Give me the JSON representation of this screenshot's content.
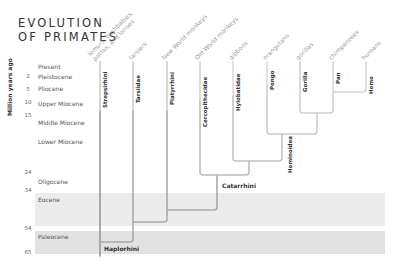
{
  "title": {
    "line1": "EVOLUTION",
    "line2": "OF PRIMATES"
  },
  "axis": {
    "label": "Million years ago",
    "ticks": [
      "2",
      "5",
      "10",
      "15",
      "24",
      "34",
      "54",
      "65"
    ]
  },
  "epochs": [
    "Present",
    "Pleistocene",
    "Pliocene",
    "Upper Miocene",
    "Middle Miocene",
    "Lower Miocene",
    "Oligocene",
    "Eocene",
    "Paleocene"
  ],
  "taxa": [
    {
      "common": "lemurs, bushbabies,",
      "common2": "pottos, and lorises",
      "scientific": "Strepsirhini"
    },
    {
      "common": "tarsiers",
      "scientific": "Tarsiidae"
    },
    {
      "common": "New World monkeys",
      "scientific": "Platyrrhini"
    },
    {
      "common": "Old World monkeys",
      "scientific": "Cercopithecidae"
    },
    {
      "common": "gibbons",
      "scientific": "Hylobatidae"
    },
    {
      "common": "orangutans",
      "scientific": "Pongo"
    },
    {
      "common": "gorillas",
      "scientific": "Gorilla"
    },
    {
      "common": "chimpanzees",
      "scientific": "Pan"
    },
    {
      "common": "humans",
      "scientific": "Homo"
    }
  ],
  "clades": {
    "haplorhini": "Haplorhini",
    "catarrhini": "Catarrhini",
    "hominoidea": "Hominoidea"
  },
  "colors": {
    "line": "#999999",
    "line_light": "#cccccc",
    "eocene_band": "#ececec",
    "paleocene_band": "#e2e2e2"
  }
}
